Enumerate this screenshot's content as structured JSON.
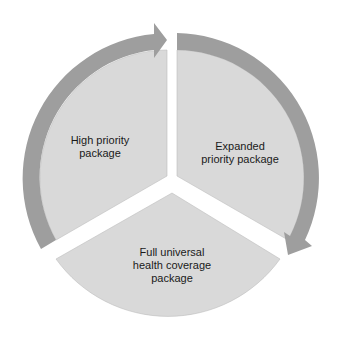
{
  "diagram": {
    "type": "cycle",
    "segments": [
      {
        "id": "high",
        "label_lines": [
          "High priority",
          "package"
        ]
      },
      {
        "id": "expanded",
        "label_lines": [
          "Expanded",
          "priority package"
        ]
      },
      {
        "id": "full",
        "label_lines": [
          "Full universal",
          "health coverage",
          "package"
        ]
      }
    ],
    "arrows": [
      {
        "from": "high",
        "to": "expanded",
        "direction": "clockwise"
      },
      {
        "from": "expanded",
        "to": "full",
        "direction": "clockwise"
      }
    ]
  },
  "colors": {
    "segment_fill": "#d9d9d9",
    "arrow_fill": "#9e9e9e",
    "background": "#ffffff"
  }
}
